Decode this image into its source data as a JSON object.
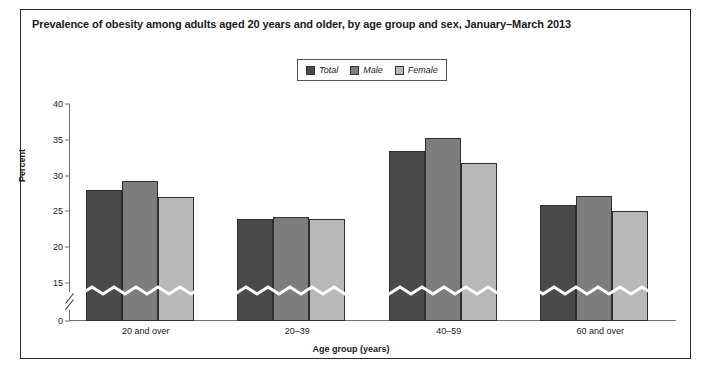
{
  "figure": {
    "title": "Prevalence of obesity among adults aged 20 years and older, by age group and sex, January–March 2013"
  },
  "legend": {
    "items": [
      {
        "label": "Total",
        "color": "#4a4a4a"
      },
      {
        "label": "Male",
        "color": "#7d7d7d"
      },
      {
        "label": "Female",
        "color": "#b8b8b8"
      }
    ]
  },
  "axes": {
    "ylabel": "Percent",
    "xlabel": "Age group (years)",
    "yticks": [
      "0",
      "15",
      "20",
      "25",
      "30",
      "35",
      "40"
    ],
    "axis_break": true
  },
  "chart_data": {
    "type": "bar",
    "title": "Prevalence of obesity among adults aged 20 years and older, by age group and sex, January–March 2013",
    "xlabel": "Age group (years)",
    "ylabel": "Percent",
    "categories": [
      "20 and over",
      "20–39",
      "40–59",
      "60 and over"
    ],
    "series": [
      {
        "name": "Total",
        "color": "#4a4a4a",
        "values": [
          28.0,
          24.0,
          33.5,
          25.9
        ]
      },
      {
        "name": "Male",
        "color": "#7d7d7d",
        "values": [
          29.2,
          24.2,
          35.2,
          27.2
        ]
      },
      {
        "name": "Female",
        "color": "#b8b8b8",
        "values": [
          27.0,
          23.9,
          31.8,
          25.0
        ]
      }
    ],
    "ylim": [
      0,
      40
    ],
    "ytick_values": [
      0,
      15,
      20,
      25,
      30,
      35,
      40
    ],
    "axis_break_between": [
      0,
      15
    ],
    "grid": false,
    "legend_position": "top-center"
  }
}
